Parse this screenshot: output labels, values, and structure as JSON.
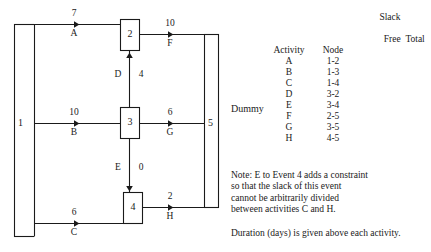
{
  "diagram": {
    "line_color": "#1a1a1a",
    "nodes": [
      {
        "id": "2",
        "label": "2"
      },
      {
        "id": "3",
        "label": "3"
      },
      {
        "id": "4",
        "label": "4"
      }
    ],
    "endpoints": [
      {
        "id": "start",
        "label": "1"
      },
      {
        "id": "finish",
        "label": "5"
      }
    ],
    "arrows": [
      {
        "activity": "A",
        "duration": "7"
      },
      {
        "activity": "B",
        "duration": "10"
      },
      {
        "activity": "C",
        "duration": "6"
      },
      {
        "activity": "D",
        "duration": "4"
      },
      {
        "activity": "E",
        "duration": "0"
      },
      {
        "activity": "F",
        "duration": "10"
      },
      {
        "activity": "G",
        "duration": "6"
      },
      {
        "activity": "H",
        "duration": "2"
      }
    ],
    "dummy_label": "Dummy"
  },
  "table": {
    "slack_group_header": "Slack",
    "headers": {
      "activity": "Activity",
      "node": "Node",
      "free": "Free",
      "total": "Total"
    },
    "rows": [
      {
        "activity": "A",
        "node": "1-2",
        "free": "",
        "total": ""
      },
      {
        "activity": "B",
        "node": "1-3",
        "free": "",
        "total": ""
      },
      {
        "activity": "C",
        "node": "1-4",
        "free": "",
        "total": ""
      },
      {
        "activity": "D",
        "node": "3-2",
        "free": "",
        "total": ""
      },
      {
        "activity": "E",
        "node": "3-4",
        "free": "",
        "total": ""
      },
      {
        "activity": "F",
        "node": "2-5",
        "free": "",
        "total": ""
      },
      {
        "activity": "G",
        "node": "3-5",
        "free": "",
        "total": ""
      },
      {
        "activity": "H",
        "node": "4-5",
        "free": "",
        "total": ""
      }
    ]
  },
  "notes": {
    "line1": "Note: E to Event 4 adds a constraint",
    "line2": "so that the slack of this event",
    "line3": "cannot be arbitrarily divided",
    "line4": "between activities C and H.",
    "duration_note": "Duration (days) is given above each activity."
  }
}
